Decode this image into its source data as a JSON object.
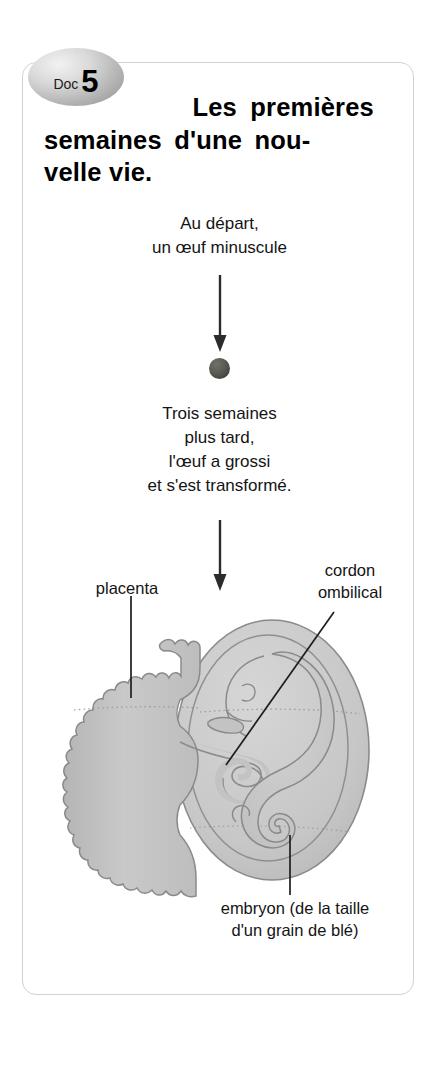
{
  "document": {
    "badge": {
      "prefix": "Doc",
      "number": "5"
    },
    "title": {
      "line1": "Les premières",
      "line2": "semaines d'une nou-",
      "line3": "velle vie."
    },
    "steps": [
      {
        "id": "step-1",
        "caption_lines": [
          "Au départ,",
          "un œuf minuscule"
        ]
      },
      {
        "id": "step-2",
        "caption_lines": [
          "Trois semaines",
          "plus tard,",
          "l'œuf a grossi",
          "et s'est transformé."
        ]
      }
    ],
    "captions": {
      "first": "Au départ,\nun œuf minuscule",
      "first_l1": "Au départ,",
      "first_l2": "un œuf minuscule",
      "second_l1": "Trois semaines",
      "second_l2": "plus tard,",
      "second_l3": "l'œuf a grossi",
      "second_l4": "et s'est transformé."
    },
    "annotations": {
      "placenta": "placenta",
      "cordon_l1": "cordon",
      "cordon_l2": "ombilical",
      "embryon_l1": "embryon (de la taille",
      "embryon_l2": "d'un grain de blé)"
    },
    "colors": {
      "frame_border": "#d2d2d2",
      "tissue_fill": "#c6c6c6",
      "sac_fill": "#cfcfcf",
      "outline": "#7e7e7e",
      "egg": "#4e5249",
      "text": "#141414",
      "arrow": "#2b2b2b"
    },
    "icons": {
      "arrow_down": "down-arrow-icon",
      "egg": "egg-cell-icon"
    }
  }
}
